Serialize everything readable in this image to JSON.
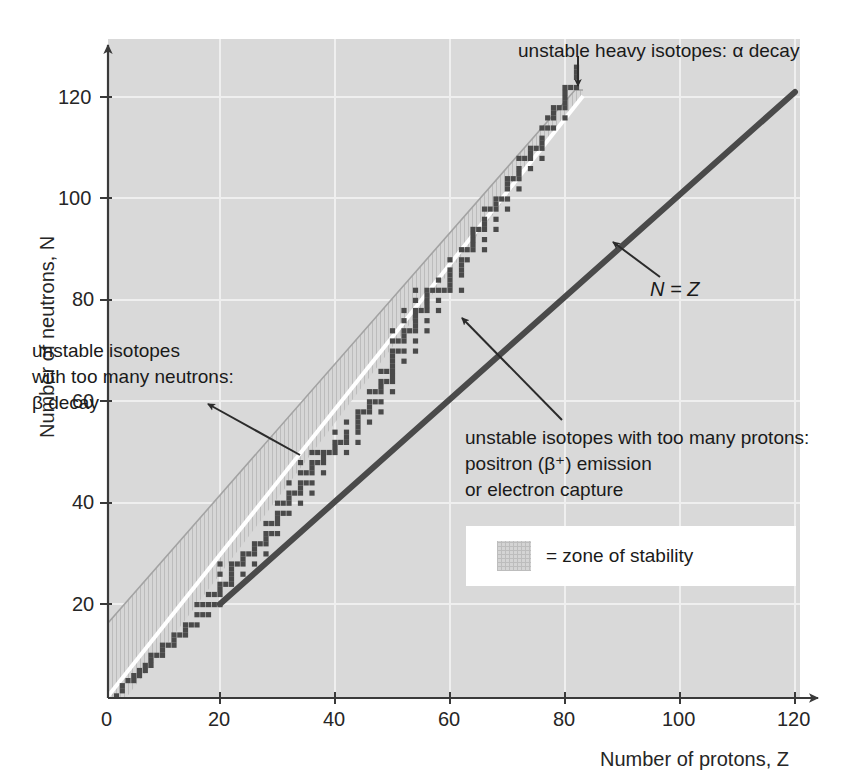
{
  "chart_data": {
    "type": "scatter",
    "title": "",
    "xlabel": "Number of protons, Z",
    "ylabel": "Number of neutrons, N",
    "xlim": [
      0,
      126
    ],
    "ylim": [
      0,
      128
    ],
    "xticks": [
      0,
      20,
      40,
      60,
      80,
      100,
      120
    ],
    "xtick_labels": [
      "0",
      "20",
      "40",
      "60",
      "80",
      "100",
      "120"
    ],
    "yticks": [
      20,
      40,
      60,
      80,
      100,
      120
    ],
    "ytick_labels": [
      "20",
      "40",
      "60",
      "80",
      "100",
      "120"
    ],
    "grid": true,
    "legend_position": "lower-right",
    "series": [
      {
        "name": "stable nuclides",
        "marker": "square",
        "color": "#4a4a4a",
        "points": [
          [
            1,
            0
          ],
          [
            1,
            1
          ],
          [
            2,
            1
          ],
          [
            2,
            2
          ],
          [
            3,
            3
          ],
          [
            3,
            4
          ],
          [
            4,
            5
          ],
          [
            5,
            5
          ],
          [
            5,
            6
          ],
          [
            6,
            6
          ],
          [
            6,
            7
          ],
          [
            7,
            7
          ],
          [
            7,
            8
          ],
          [
            8,
            8
          ],
          [
            8,
            9
          ],
          [
            8,
            10
          ],
          [
            9,
            10
          ],
          [
            10,
            10
          ],
          [
            10,
            11
          ],
          [
            10,
            12
          ],
          [
            11,
            12
          ],
          [
            12,
            12
          ],
          [
            12,
            13
          ],
          [
            12,
            14
          ],
          [
            13,
            14
          ],
          [
            14,
            14
          ],
          [
            14,
            15
          ],
          [
            14,
            16
          ],
          [
            15,
            16
          ],
          [
            16,
            16
          ],
          [
            16,
            18
          ],
          [
            16,
            20
          ],
          [
            17,
            18
          ],
          [
            17,
            20
          ],
          [
            18,
            18
          ],
          [
            18,
            20
          ],
          [
            18,
            22
          ],
          [
            19,
            20
          ],
          [
            19,
            22
          ],
          [
            20,
            20
          ],
          [
            20,
            22
          ],
          [
            20,
            23
          ],
          [
            20,
            24
          ],
          [
            20,
            26
          ],
          [
            20,
            28
          ],
          [
            21,
            24
          ],
          [
            22,
            24
          ],
          [
            22,
            25
          ],
          [
            22,
            26
          ],
          [
            22,
            27
          ],
          [
            22,
            28
          ],
          [
            23,
            28
          ],
          [
            24,
            26
          ],
          [
            24,
            28
          ],
          [
            24,
            29
          ],
          [
            24,
            30
          ],
          [
            25,
            30
          ],
          [
            26,
            28
          ],
          [
            26,
            30
          ],
          [
            26,
            31
          ],
          [
            26,
            32
          ],
          [
            27,
            32
          ],
          [
            28,
            30
          ],
          [
            28,
            32
          ],
          [
            28,
            33
          ],
          [
            28,
            34
          ],
          [
            28,
            36
          ],
          [
            29,
            34
          ],
          [
            29,
            36
          ],
          [
            30,
            34
          ],
          [
            30,
            36
          ],
          [
            30,
            37
          ],
          [
            30,
            38
          ],
          [
            30,
            40
          ],
          [
            31,
            38
          ],
          [
            31,
            40
          ],
          [
            32,
            38
          ],
          [
            32,
            40
          ],
          [
            32,
            41
          ],
          [
            32,
            42
          ],
          [
            32,
            44
          ],
          [
            33,
            42
          ],
          [
            34,
            40
          ],
          [
            34,
            42
          ],
          [
            34,
            43
          ],
          [
            34,
            44
          ],
          [
            34,
            46
          ],
          [
            34,
            48
          ],
          [
            35,
            44
          ],
          [
            35,
            46
          ],
          [
            36,
            42
          ],
          [
            36,
            44
          ],
          [
            36,
            46
          ],
          [
            36,
            47
          ],
          [
            36,
            48
          ],
          [
            36,
            50
          ],
          [
            37,
            48
          ],
          [
            37,
            50
          ],
          [
            38,
            46
          ],
          [
            38,
            48
          ],
          [
            38,
            49
          ],
          [
            38,
            50
          ],
          [
            39,
            50
          ],
          [
            40,
            50
          ],
          [
            40,
            51
          ],
          [
            40,
            52
          ],
          [
            40,
            54
          ],
          [
            41,
            52
          ],
          [
            42,
            50
          ],
          [
            42,
            52
          ],
          [
            42,
            53
          ],
          [
            42,
            54
          ],
          [
            42,
            56
          ],
          [
            44,
            52
          ],
          [
            44,
            54
          ],
          [
            44,
            55
          ],
          [
            44,
            56
          ],
          [
            44,
            57
          ],
          [
            44,
            58
          ],
          [
            45,
            58
          ],
          [
            46,
            56
          ],
          [
            46,
            58
          ],
          [
            46,
            59
          ],
          [
            46,
            60
          ],
          [
            46,
            62
          ],
          [
            47,
            60
          ],
          [
            47,
            62
          ],
          [
            48,
            58
          ],
          [
            48,
            60
          ],
          [
            48,
            62
          ],
          [
            48,
            63
          ],
          [
            48,
            64
          ],
          [
            48,
            66
          ],
          [
            49,
            64
          ],
          [
            49,
            66
          ],
          [
            50,
            62
          ],
          [
            50,
            64
          ],
          [
            50,
            65
          ],
          [
            50,
            66
          ],
          [
            50,
            67
          ],
          [
            50,
            68
          ],
          [
            50,
            69
          ],
          [
            50,
            70
          ],
          [
            50,
            72
          ],
          [
            50,
            74
          ],
          [
            51,
            70
          ],
          [
            51,
            72
          ],
          [
            52,
            68
          ],
          [
            52,
            70
          ],
          [
            52,
            72
          ],
          [
            52,
            73
          ],
          [
            52,
            74
          ],
          [
            52,
            76
          ],
          [
            52,
            78
          ],
          [
            53,
            74
          ],
          [
            54,
            70
          ],
          [
            54,
            72
          ],
          [
            54,
            74
          ],
          [
            54,
            75
          ],
          [
            54,
            76
          ],
          [
            54,
            77
          ],
          [
            54,
            78
          ],
          [
            54,
            80
          ],
          [
            54,
            82
          ],
          [
            55,
            78
          ],
          [
            56,
            74
          ],
          [
            56,
            76
          ],
          [
            56,
            78
          ],
          [
            56,
            79
          ],
          [
            56,
            80
          ],
          [
            56,
            81
          ],
          [
            56,
            82
          ],
          [
            57,
            82
          ],
          [
            58,
            78
          ],
          [
            58,
            80
          ],
          [
            58,
            82
          ],
          [
            58,
            84
          ],
          [
            59,
            82
          ],
          [
            60,
            82
          ],
          [
            60,
            83
          ],
          [
            60,
            84
          ],
          [
            60,
            85
          ],
          [
            60,
            86
          ],
          [
            60,
            88
          ],
          [
            62,
            82
          ],
          [
            62,
            85
          ],
          [
            62,
            86
          ],
          [
            62,
            87
          ],
          [
            62,
            88
          ],
          [
            62,
            90
          ],
          [
            63,
            88
          ],
          [
            63,
            90
          ],
          [
            64,
            90
          ],
          [
            64,
            91
          ],
          [
            64,
            92
          ],
          [
            64,
            93
          ],
          [
            64,
            94
          ],
          [
            65,
            94
          ],
          [
            66,
            90
          ],
          [
            66,
            92
          ],
          [
            66,
            94
          ],
          [
            66,
            95
          ],
          [
            66,
            96
          ],
          [
            66,
            98
          ],
          [
            67,
            98
          ],
          [
            68,
            94
          ],
          [
            68,
            96
          ],
          [
            68,
            98
          ],
          [
            68,
            99
          ],
          [
            68,
            100
          ],
          [
            69,
            100
          ],
          [
            70,
            98
          ],
          [
            70,
            100
          ],
          [
            70,
            102
          ],
          [
            70,
            103
          ],
          [
            70,
            104
          ],
          [
            71,
            104
          ],
          [
            72,
            102
          ],
          [
            72,
            104
          ],
          [
            72,
            105
          ],
          [
            72,
            106
          ],
          [
            72,
            108
          ],
          [
            73,
            108
          ],
          [
            74,
            106
          ],
          [
            74,
            108
          ],
          [
            74,
            109
          ],
          [
            74,
            110
          ],
          [
            75,
            110
          ],
          [
            76,
            108
          ],
          [
            76,
            110
          ],
          [
            76,
            111
          ],
          [
            76,
            112
          ],
          [
            76,
            114
          ],
          [
            77,
            114
          ],
          [
            77,
            116
          ],
          [
            78,
            114
          ],
          [
            78,
            116
          ],
          [
            78,
            117
          ],
          [
            78,
            118
          ],
          [
            79,
            118
          ],
          [
            80,
            116
          ],
          [
            80,
            118
          ],
          [
            80,
            119
          ],
          [
            80,
            120
          ],
          [
            80,
            121
          ],
          [
            80,
            122
          ],
          [
            81,
            122
          ],
          [
            82,
            122
          ],
          [
            82,
            124
          ],
          [
            82,
            125
          ],
          [
            82,
            126
          ]
        ]
      }
    ],
    "reference_lines": [
      {
        "name": "N = Z",
        "label": "N = Z",
        "color": "#4a4a4a",
        "from": [
          20,
          20
        ],
        "to": [
          120,
          120
        ]
      }
    ],
    "regions": [
      {
        "name": "zone of stability",
        "label": "= zone of stability",
        "fill": "#d4d4d4",
        "hatch": "vertical",
        "upper_boundary_color": "#a0a0a0",
        "lower_boundary_color": "#ffffff"
      }
    ]
  },
  "axes": {
    "y_title": "Number of neutrons, N",
    "x_title": "Number of protons, Z",
    "x_tick_labels": [
      "0",
      "20",
      "40",
      "60",
      "80",
      "100",
      "120"
    ],
    "y_tick_labels": [
      "120",
      "100",
      "80",
      "60",
      "40",
      "20"
    ]
  },
  "annotations": {
    "alpha": {
      "line1": "unstable heavy isotopes: α decay"
    },
    "beta_minus": {
      "line1": "unstable isotopes",
      "line2": "with too many neutrons:",
      "line3": "β decay"
    },
    "beta_plus": {
      "line1": "unstable isotopes with too many protons:",
      "line2": "positron (β⁺) emission",
      "line3": "or electron capture"
    },
    "nz_line": "N = Z"
  },
  "legend": {
    "text": "= zone of stability"
  },
  "colors": {
    "plot_background": "#d9d9d9",
    "gridline": "#efefef",
    "axis": "#3a3a3a",
    "dot": "#4a4a4a",
    "nz_line": "#4a4a4a",
    "band_upper_edge": "#a0a0a0",
    "band_lower_edge": "#ffffff",
    "legend_background": "#ffffff"
  }
}
